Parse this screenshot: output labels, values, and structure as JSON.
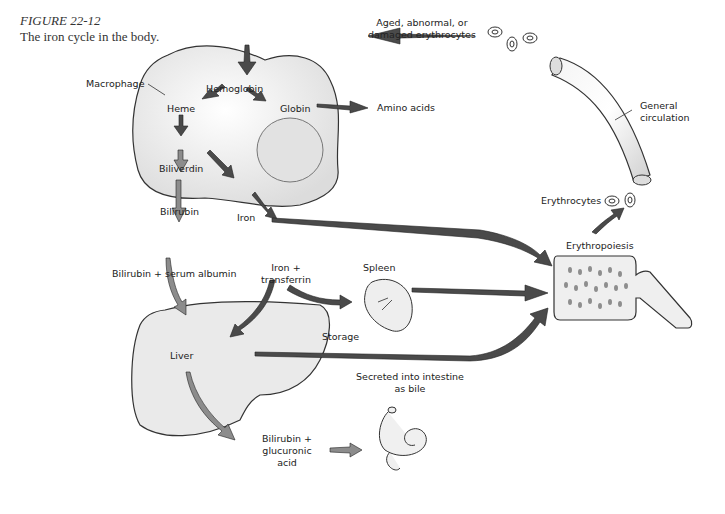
{
  "figure": {
    "number": "FIGURE 22-12",
    "caption": "The iron cycle in the body."
  },
  "labels": {
    "aged_line1": "Aged, abnormal, or",
    "aged_line2": "damaged erythrocytes",
    "macrophage": "Macrophage",
    "hemoglobin": "Hemoglobin",
    "heme": "Heme",
    "globin": "Globin",
    "amino_acids": "Amino acids",
    "biliverdin": "Biliverdin",
    "bilirubin": "Bilirubin",
    "iron": "Iron",
    "bilirubin_albumin": "Bilirubin + serum albumin",
    "iron_transferrin_line1": "Iron +",
    "iron_transferrin_line2": "transferrin",
    "spleen": "Spleen",
    "storage": "Storage",
    "liver": "Liver",
    "secreted_line1": "Secreted into intestine",
    "secreted_line2": "as bile",
    "bili_gluc_line1": "Bilirubin +",
    "bili_gluc_line2": "glucuronic",
    "bili_gluc_line3": "acid",
    "general_circulation_line1": "General",
    "general_circulation_line2": "circulation",
    "erythrocytes": "Erythrocytes",
    "erythropoiesis": "Erythropoiesis"
  },
  "colors": {
    "arrow_dark": "#4a4a4a",
    "arrow_light": "#8c8c8c",
    "outline": "#333333",
    "organ_fill": "#ececec"
  }
}
